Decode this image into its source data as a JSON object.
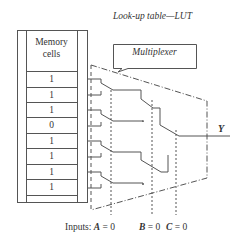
{
  "title": "Look-up table—LUT",
  "memory": {
    "header_line1": "Memory",
    "header_line2": "cells",
    "cells": [
      "1",
      "1",
      "1",
      "0",
      "1",
      "1",
      "1",
      "1"
    ]
  },
  "multiplexer": {
    "label": "Multiplexer"
  },
  "output": {
    "label": "Y"
  },
  "inputs": {
    "prefix": "Inputs:",
    "a_name": "A",
    "a_value": "= 0",
    "b_name": "B",
    "b_value": "= 0",
    "c_name": "C",
    "c_value": "= 0"
  },
  "colors": {
    "line": "#555555",
    "text": "#333333",
    "background": "#ffffff"
  }
}
